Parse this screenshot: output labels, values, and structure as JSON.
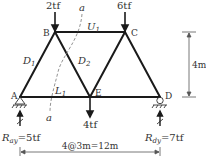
{
  "diagram": {
    "type": "truss",
    "nodes": {
      "A": {
        "label": "A",
        "x": 20,
        "y": 97
      },
      "B": {
        "label": "B",
        "x": 55,
        "y": 32
      },
      "C": {
        "label": "C",
        "x": 125,
        "y": 32
      },
      "D": {
        "label": "D",
        "x": 160,
        "y": 97
      },
      "E": {
        "label": "E",
        "x": 90,
        "y": 97
      }
    },
    "members": {
      "D1": {
        "label": "D",
        "sub": "1"
      },
      "D2": {
        "label": "D",
        "sub": "2"
      },
      "U1": {
        "label": "U",
        "sub": "1"
      },
      "L1": {
        "label": "L",
        "sub": "1"
      }
    },
    "loads": {
      "B": "2tf",
      "C": "6tf",
      "E": "4tf"
    },
    "section_label": "a",
    "reactions": {
      "A": {
        "label": "R",
        "sub": "ay",
        "value": "=5tf"
      },
      "D": {
        "label": "R",
        "sub": "dy",
        "value": "=7tf"
      }
    },
    "dimensions": {
      "height": "4m",
      "span": "4@3m=12m"
    }
  }
}
